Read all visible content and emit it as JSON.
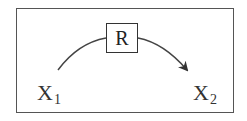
{
  "diagram": {
    "type": "process-flow",
    "nodes": [
      {
        "id": "x1",
        "label": "X",
        "subscript": "1"
      },
      {
        "id": "r",
        "label": "R",
        "boxed": true
      },
      {
        "id": "x2",
        "label": "X",
        "subscript": "2"
      }
    ],
    "edges": [
      {
        "from": "x1",
        "to": "x2",
        "via": "r",
        "style": "curved-arrow"
      }
    ],
    "colors": {
      "stroke": "#333333",
      "frame": "#555555",
      "background": "#ffffff"
    }
  }
}
